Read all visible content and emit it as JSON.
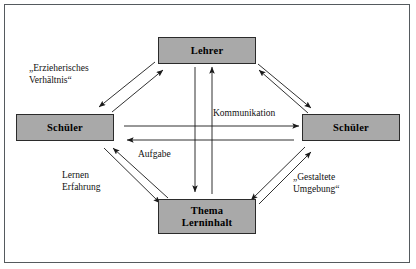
{
  "diagram": {
    "frame": {
      "border_color": "#555a5e"
    },
    "node_fill_color": "#a9a9a9",
    "node_border_color": "#2b2b2b",
    "arrow_color": "#1a1a1a",
    "nodes": [
      {
        "id": "lehrer",
        "label": "Lehrer"
      },
      {
        "id": "schueler_left",
        "label": "Schüler"
      },
      {
        "id": "schueler_right",
        "label": "Schüler"
      },
      {
        "id": "thema_line1",
        "label": "Thema"
      },
      {
        "id": "thema_line2",
        "label": "Lerninhalt"
      }
    ],
    "edge_labels": [
      {
        "id": "erzieherisches",
        "text": "„Erzieherisches\nVerhältnis“"
      },
      {
        "id": "kommunikation",
        "text": "Kommunikation"
      },
      {
        "id": "aufgabe",
        "text": "Aufgabe"
      },
      {
        "id": "lernen_erfahrung",
        "text": "Lernen\nErfahrung"
      },
      {
        "id": "gestaltete_umgebung",
        "text": "„Gestaltete\nUmgebung“"
      }
    ]
  }
}
